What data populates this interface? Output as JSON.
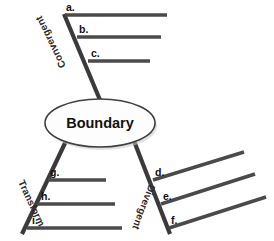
{
  "diagram": {
    "type": "concept-map",
    "center_node": {
      "label": "Boundary",
      "shape": "ellipse",
      "cx": 100,
      "cy": 123,
      "rx": 55,
      "ry": 24
    },
    "branches": [
      {
        "id": "convergent",
        "label": "Convergent",
        "position": "upper-left",
        "label_rotation": -116,
        "stem": {
          "x1": 100,
          "y1": 100,
          "x2": 64,
          "y2": 14
        },
        "items": [
          {
            "letter": "a.",
            "label_x": 66,
            "label_y": 11,
            "line": {
              "x1": 65,
              "y1": 15,
              "x2": 167,
              "y2": 15
            }
          },
          {
            "letter": "b.",
            "label_x": 79,
            "label_y": 33,
            "line": {
              "x1": 77,
              "y1": 37,
              "x2": 161,
              "y2": 37
            }
          },
          {
            "letter": "c.",
            "label_x": 91,
            "label_y": 57,
            "line": {
              "x1": 88,
              "y1": 61,
              "x2": 150,
              "y2": 61
            }
          }
        ]
      },
      {
        "id": "divergent",
        "label": "Divergent",
        "position": "lower-right",
        "label_rotation": 74,
        "stem": {
          "x1": 134,
          "y1": 141,
          "x2": 170,
          "y2": 234
        },
        "items": [
          {
            "letter": "d.",
            "label_x": 155,
            "label_y": 176,
            "line": {
              "x1": 153,
              "y1": 180,
              "x2": 244,
              "y2": 152
            }
          },
          {
            "letter": "e.",
            "label_x": 163,
            "label_y": 200,
            "line": {
              "x1": 161,
              "y1": 204,
              "x2": 255,
              "y2": 174
            }
          },
          {
            "letter": "f.",
            "label_x": 171,
            "label_y": 224,
            "line": {
              "x1": 169,
              "y1": 228,
              "x2": 266,
              "y2": 197
            }
          }
        ]
      },
      {
        "id": "transform",
        "label": "Transform",
        "position": "lower-left",
        "label_rotation": 67,
        "stem": {
          "x1": 66,
          "y1": 141,
          "x2": 22,
          "y2": 234
        },
        "items": [
          {
            "letter": "g.",
            "label_x": 50,
            "label_y": 176,
            "line": {
              "x1": 48,
              "y1": 180,
              "x2": 106,
              "y2": 180
            }
          },
          {
            "letter": "h.",
            "label_x": 41,
            "label_y": 200,
            "line": {
              "x1": 37,
              "y1": 204,
              "x2": 115,
              "y2": 204
            }
          },
          {
            "letter": "i.",
            "label_x": 32,
            "label_y": 224,
            "line": {
              "x1": 27,
              "y1": 228,
              "x2": 122,
              "y2": 228
            }
          }
        ]
      }
    ],
    "colors": {
      "line": "#3a3a3a",
      "answer_line": "#4a4a4a",
      "node_fill": "#fdfdfd",
      "node_stroke": "#3f3f3f",
      "text": "#111111",
      "background": "#ffffff"
    }
  }
}
